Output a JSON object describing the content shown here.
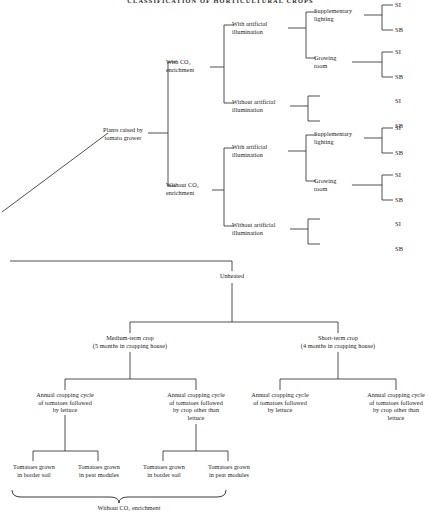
{
  "document": {
    "title": "CLASSIFICATION OF HORTICULTURAL CROPS"
  },
  "top_tree": {
    "root": "Plants raised by\ntomato grower",
    "level1": [
      {
        "label": "With CO₂\nenrichment"
      },
      {
        "label": "Without CO₂\nenrichment"
      }
    ],
    "level2": [
      {
        "label": "With artificial\nillumination"
      },
      {
        "label": "Without artificial\nillumination"
      },
      {
        "label": "With artificial\nillumination"
      },
      {
        "label": "Without artificial\nillumination"
      }
    ],
    "level3": [
      {
        "label": "Supplementary\nlighting"
      },
      {
        "label": "Growing\nroom"
      },
      {
        "label": "Supplementary\nlighting"
      },
      {
        "label": "Growing\nroom"
      }
    ],
    "leaves": [
      {
        "label": "SI"
      },
      {
        "label": "SB"
      },
      {
        "label": "SI"
      },
      {
        "label": "SB"
      },
      {
        "label": "SI"
      },
      {
        "label": "SB"
      },
      {
        "label": "SI"
      },
      {
        "label": "SB"
      },
      {
        "label": "SI"
      },
      {
        "label": "SB"
      },
      {
        "label": "SI"
      },
      {
        "label": "SB"
      },
      {
        "label": "SI"
      },
      {
        "label": "SB"
      },
      {
        "label": "SI"
      },
      {
        "label": "SB"
      }
    ]
  },
  "bottom_tree": {
    "root": "Unheated",
    "level1": [
      {
        "label": "Medium-term crop\n(5 months in cropping house)"
      },
      {
        "label": "Short-term crop\n(4 months in cropping house)"
      }
    ],
    "level2": [
      {
        "label": "Annual cropping cycle\nof tomatoes followed\nby lettuce"
      },
      {
        "label": "Annual cropping cycle\nof tomatoes followed\nby crop other than\nlettuce"
      },
      {
        "label": "Annual cropping cycle\nof tomatoes followed\nby lettuce"
      },
      {
        "label": "Annual cropping cycle\nof tomatoes followed\nby crop other than\nlettuce"
      }
    ],
    "leaves": [
      {
        "label": "Tomatoes grown\nin border soil"
      },
      {
        "label": "Tomatoes grown\nin peat modules"
      },
      {
        "label": "Tomatoes grown\nin border soil"
      },
      {
        "label": "Tomatoes grown\nin peat modules"
      }
    ],
    "brace_label": "Without CO₂ enrichment"
  }
}
